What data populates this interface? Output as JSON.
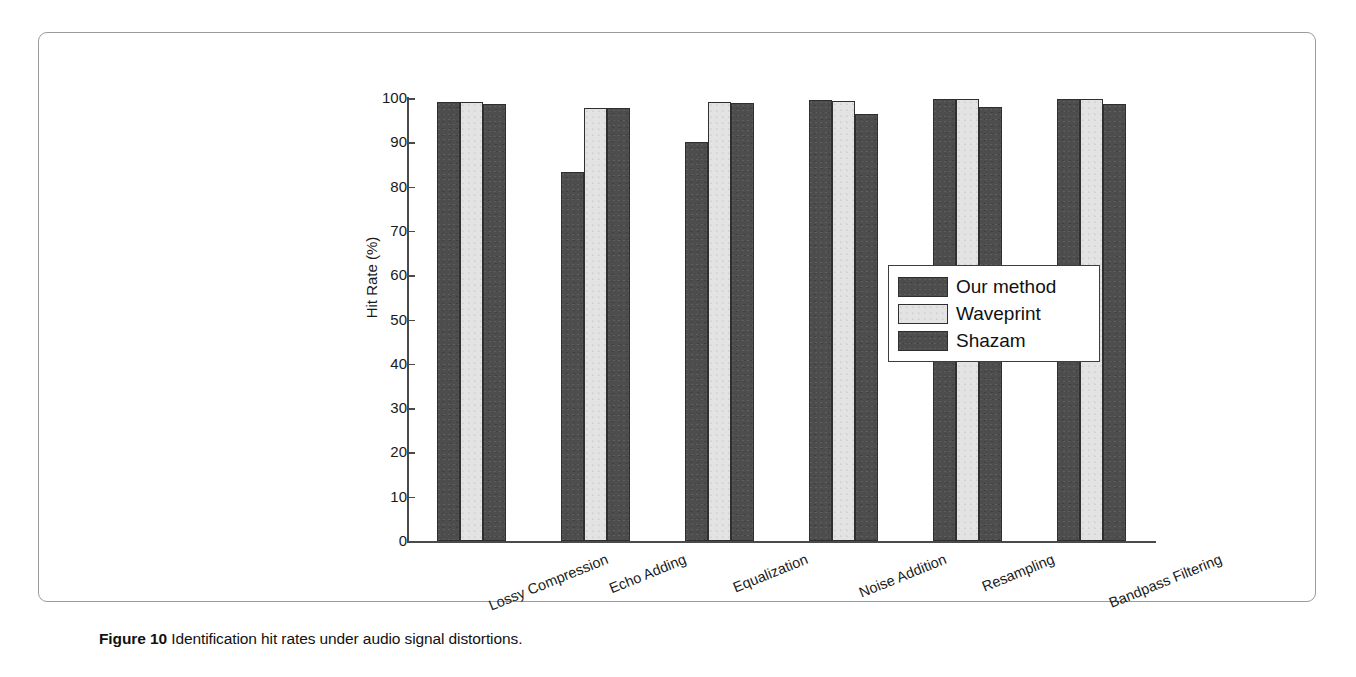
{
  "caption": {
    "label": "Figure 10",
    "text": "Identification hit rates under audio signal distortions."
  },
  "legend": {
    "position": "middle-right",
    "items": [
      {
        "label": "Our method",
        "color": "#4d4d4d"
      },
      {
        "label": "Waveprint",
        "color": "#e3e3e3"
      },
      {
        "label": "Shazam",
        "color": "#4d4d4d"
      }
    ]
  },
  "axis": {
    "y_label": "Hit Rate (%)",
    "y_ticks": [
      "0",
      "10",
      "20",
      "30",
      "40",
      "50",
      "60",
      "70",
      "80",
      "90",
      "100"
    ]
  },
  "chart_data": {
    "type": "bar",
    "title": "",
    "xlabel": "",
    "ylabel": "Hit Rate (%)",
    "ylim": [
      0,
      100
    ],
    "ytick_step": 10,
    "grid": false,
    "legend_position": "middle-right",
    "categories": [
      "Lossy Compression",
      "Echo Adding",
      "Equalization",
      "Noise Addition",
      "Resampling",
      "Bandpass Filtering"
    ],
    "series": [
      {
        "name": "Our method",
        "color": "#4d4d4d",
        "values": [
          99.0,
          83.4,
          90.0,
          99.5,
          99.7,
          99.7
        ]
      },
      {
        "name": "Waveprint",
        "color": "#e3e3e3",
        "values": [
          99.0,
          97.8,
          99.0,
          99.4,
          99.8,
          99.7
        ]
      },
      {
        "name": "Shazam",
        "color": "#4d4d4d",
        "values": [
          98.7,
          97.8,
          98.8,
          96.5,
          98.0,
          98.6
        ]
      }
    ]
  }
}
